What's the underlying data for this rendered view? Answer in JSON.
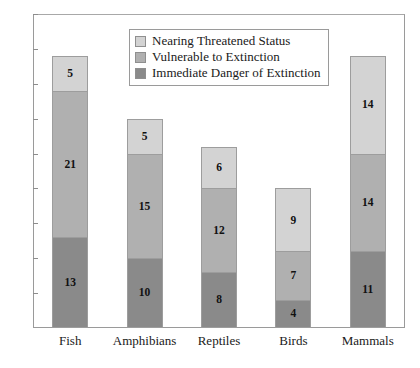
{
  "chart_data": {
    "type": "bar",
    "subtype": "stacked-bar",
    "title": "",
    "xlabel": "",
    "ylabel": "",
    "ylim": [
      0,
      45
    ],
    "ytick_step": 5,
    "yticks": [
      "0",
      "5",
      "10",
      "15",
      "20",
      "25",
      "30",
      "35",
      "40",
      "45"
    ],
    "grid": false,
    "legend_position": "top-center",
    "categories": [
      "Fish",
      "Amphibians",
      "Reptiles",
      "Birds",
      "Mammals"
    ],
    "series": [
      {
        "name": "Immediate Danger of Extinction",
        "color": "#8a8a8a",
        "values": [
          13,
          10,
          8,
          4,
          11
        ]
      },
      {
        "name": "Vulnerable to Extinction",
        "color": "#b0b0b0",
        "values": [
          21,
          15,
          12,
          7,
          14
        ]
      },
      {
        "name": "Nearing Threatened Status",
        "color": "#d3d3d3",
        "values": [
          5,
          5,
          6,
          9,
          14
        ]
      }
    ],
    "totals": [
      39,
      30,
      26,
      20,
      39
    ],
    "legend": [
      {
        "label": "Nearing Threatened Status",
        "color": "#d3d3d3"
      },
      {
        "label": "Vulnerable to Extinction",
        "color": "#b0b0b0"
      },
      {
        "label": "Immediate Danger of Extinction",
        "color": "#8a8a8a"
      }
    ]
  },
  "colors": {
    "nearing_threatened": "#d3d3d3",
    "vulnerable": "#b0b0b0",
    "immediate_danger": "#8a8a8a",
    "axis": "#9a9a9a",
    "text": "#1a1a1a",
    "background": "#ffffff"
  }
}
